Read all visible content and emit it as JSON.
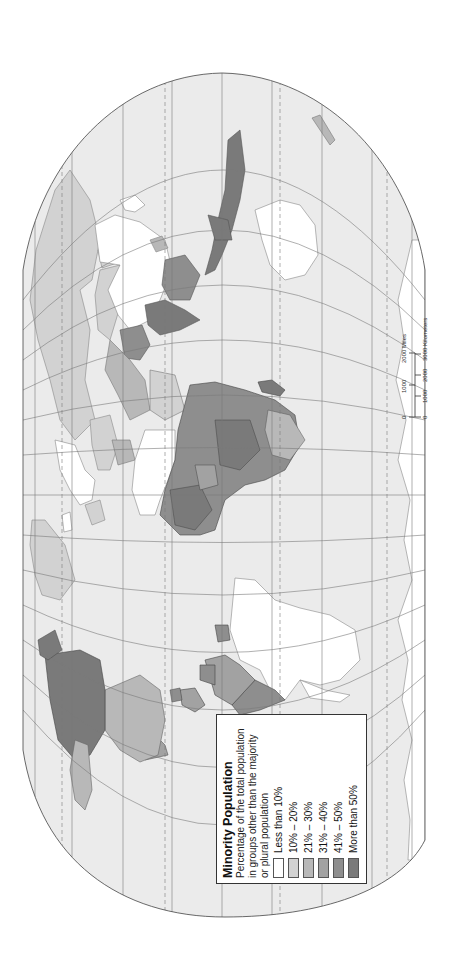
{
  "map": {
    "orientation": "rotated 90° counter-clockwise (north to the left)",
    "ocean_color": "#ebebeb",
    "outline_color": "#444444",
    "graticule_color": "#777777"
  },
  "legend": {
    "title": "Minority Population",
    "subtitle_lines": [
      "Percentage of the total population",
      "in groups other than the majority",
      "or plural population"
    ],
    "items": [
      {
        "label": "Less than 10%",
        "color": "#ffffff"
      },
      {
        "label": "10% – 20%",
        "color": "#d2d2d2"
      },
      {
        "label": "21% – 30%",
        "color": "#b8b8b8"
      },
      {
        "label": "31% – 40%",
        "color": "#a2a2a2"
      },
      {
        "label": "41% – 50%",
        "color": "#8e8e8e"
      },
      {
        "label": "More than 50%",
        "color": "#7a7a7a"
      }
    ]
  },
  "scale_bar": {
    "miles_ticks": [
      "0",
      "1000",
      "2000 Miles"
    ],
    "km_ticks": [
      "0",
      "1000",
      "2000",
      "3000 Kilometers"
    ]
  },
  "regions": [
    {
      "name": "Canada",
      "class": "More than 50%"
    },
    {
      "name": "United States",
      "class": "21% – 30%"
    },
    {
      "name": "Alaska",
      "class": "10% – 20%"
    },
    {
      "name": "Mexico",
      "class": "31% – 40%"
    },
    {
      "name": "Greenland",
      "class": "10% – 20%"
    },
    {
      "name": "Brazil",
      "class": "Less than 10%"
    },
    {
      "name": "Argentina",
      "class": "Less than 10%"
    },
    {
      "name": "Andean South America",
      "class": "41% – 50%"
    },
    {
      "name": "Russia",
      "class": "10% – 20%"
    },
    {
      "name": "China",
      "class": "Less than 10%"
    },
    {
      "name": "India",
      "class": "More than 50%"
    },
    {
      "name": "Southeast Asia",
      "class": "41% – 50%"
    },
    {
      "name": "Indonesia",
      "class": "More than 50%"
    },
    {
      "name": "Australia",
      "class": "Less than 10%"
    },
    {
      "name": "North Africa",
      "class": "Less than 10%"
    },
    {
      "name": "Sub-Saharan Africa",
      "class": "More than 50%"
    },
    {
      "name": "Madagascar",
      "class": "More than 50%"
    },
    {
      "name": "Western Europe",
      "class": "Less than 10%"
    },
    {
      "name": "Antarctica",
      "class": "Less than 10%"
    }
  ]
}
